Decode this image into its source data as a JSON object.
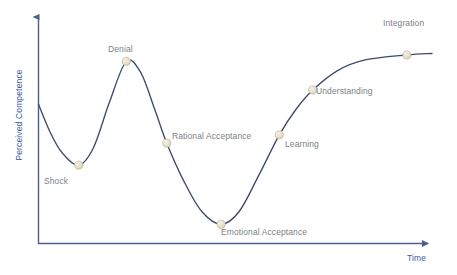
{
  "chart_data": {
    "type": "line",
    "title": "",
    "subtitle": "",
    "xlabel": "Time",
    "ylabel": "Perceived Competence",
    "grid": false,
    "legend": null,
    "axis_style": "arrowed",
    "xlim": [
      0,
      100
    ],
    "ylim": [
      0,
      100
    ],
    "line_color": "#3d4a6b",
    "marker_color": "#e6e1cb",
    "marker_edge_color": "#b9b49a",
    "axis_color": "#4a5f8e",
    "label_color": "#7b7f86",
    "axis_label_color": "#3b5c9f",
    "annotations": [
      {
        "name": "Shock",
        "x": 10.2,
        "y": 36.7,
        "label_pos": "below"
      },
      {
        "name": "Denial",
        "x": 22.3,
        "y": 85.3,
        "label_pos": "above"
      },
      {
        "name": "Rational Acceptance",
        "x": 32.6,
        "y": 47.0,
        "label_pos": "right"
      },
      {
        "name": "Emotional Acceptance",
        "x": 46.4,
        "y": 9.0,
        "label_pos": "below-right"
      },
      {
        "name": "Learning",
        "x": 61.2,
        "y": 50.9,
        "label_pos": "right"
      },
      {
        "name": "Understanding",
        "x": 69.7,
        "y": 71.9,
        "label_pos": "right"
      },
      {
        "name": "Integration",
        "x": 93.6,
        "y": 88.3,
        "label_pos": "above"
      }
    ],
    "curve_points": [
      {
        "x": 0.0,
        "y": 65.2
      },
      {
        "x": 3.0,
        "y": 52.0
      },
      {
        "x": 6.0,
        "y": 42.5
      },
      {
        "x": 10.2,
        "y": 36.7
      },
      {
        "x": 14.0,
        "y": 45.0
      },
      {
        "x": 18.0,
        "y": 66.0
      },
      {
        "x": 22.3,
        "y": 85.3
      },
      {
        "x": 26.0,
        "y": 80.0
      },
      {
        "x": 29.5,
        "y": 63.0
      },
      {
        "x": 32.6,
        "y": 47.0
      },
      {
        "x": 37.0,
        "y": 29.0
      },
      {
        "x": 41.5,
        "y": 15.0
      },
      {
        "x": 46.4,
        "y": 9.0
      },
      {
        "x": 51.0,
        "y": 15.0
      },
      {
        "x": 56.0,
        "y": 32.0
      },
      {
        "x": 61.2,
        "y": 50.9
      },
      {
        "x": 65.5,
        "y": 63.0
      },
      {
        "x": 69.7,
        "y": 71.9
      },
      {
        "x": 76.0,
        "y": 81.0
      },
      {
        "x": 83.0,
        "y": 86.0
      },
      {
        "x": 93.6,
        "y": 88.3
      },
      {
        "x": 100.0,
        "y": 89.0
      }
    ]
  },
  "axes": {
    "y_title": "Perceived Competence",
    "x_title": "Time"
  },
  "points": {
    "shock": "Shock",
    "denial": "Denial",
    "rational_acceptance": "Rational Acceptance",
    "emotional_acceptance": "Emotional Acceptance",
    "learning": "Learning",
    "understanding": "Understanding",
    "integration": "Integration"
  }
}
